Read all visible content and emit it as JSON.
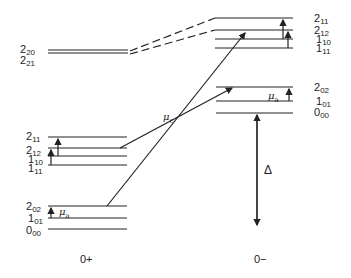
{
  "diagram": {
    "left_column_label": "0+",
    "right_column_label": "0−",
    "left_levels_top": [
      {
        "main": "2",
        "sub": "20"
      },
      {
        "main": "2",
        "sub": "21"
      }
    ],
    "left_levels_mid": [
      {
        "main": "2",
        "sub": "11"
      },
      {
        "main": "2",
        "sub": "12"
      },
      {
        "main": "1",
        "sub": "10"
      },
      {
        "main": "1",
        "sub": "11"
      }
    ],
    "left_levels_bottom": [
      {
        "main": "2",
        "sub": "02"
      },
      {
        "main": "1",
        "sub": "01"
      },
      {
        "main": "0",
        "sub": "00"
      }
    ],
    "right_levels_top": [
      {
        "main": "2",
        "sub": "11"
      },
      {
        "main": "2",
        "sub": "12"
      },
      {
        "main": "1",
        "sub": "10"
      },
      {
        "main": "1",
        "sub": "11"
      }
    ],
    "right_levels_bottom": [
      {
        "main": "2",
        "sub": "02"
      },
      {
        "main": "1",
        "sub": "01"
      },
      {
        "main": "0",
        "sub": "00"
      }
    ],
    "mu_a_left": {
      "sym": "μ",
      "sub": "a"
    },
    "mu_a_right": {
      "sym": "μ",
      "sub": "a"
    },
    "mu_c": {
      "sym": "μ",
      "sub": "c"
    },
    "delta": "Δ"
  }
}
